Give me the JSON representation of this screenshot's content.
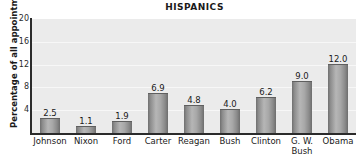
{
  "chart_data": {
    "type": "bar",
    "title": "HISPANICS",
    "xlabel": "",
    "ylabel": "Percentage of all appointments",
    "categories": [
      "Johnson",
      "Nixon",
      "Ford",
      "Carter",
      "Reagan",
      "Bush",
      "Clinton",
      "G. W. Bush",
      "Obama"
    ],
    "category_lines": [
      [
        "Johnson"
      ],
      [
        "Nixon"
      ],
      [
        "Ford"
      ],
      [
        "Carter"
      ],
      [
        "Reagan"
      ],
      [
        "Bush"
      ],
      [
        "Clinton"
      ],
      [
        "G. W.",
        "Bush"
      ],
      [
        "Obama"
      ]
    ],
    "values": [
      2.5,
      1.1,
      1.9,
      6.9,
      4.8,
      4.0,
      6.2,
      9.0,
      12.0
    ],
    "value_labels": [
      "2.5",
      "1.1",
      "1.9",
      "6.9",
      "4.8",
      "4.0",
      "6.2",
      "9.0",
      "12.0"
    ],
    "ylim": [
      0,
      20
    ],
    "yticks": [
      20,
      16,
      12,
      8,
      4
    ],
    "ytick_labels": [
      "20",
      "16",
      "12",
      "8",
      "4"
    ],
    "grid": true,
    "grid_axis": "y",
    "legend": false,
    "colors": {
      "bar_light": "#b6b6b6",
      "bar_dark": "#6f6f6f",
      "plot_background": "#ebebeb",
      "gridline": "#f7f7f7",
      "axis": "#2b2b2b",
      "text": "#1a1a1a",
      "figure_background": "#ffffff"
    }
  }
}
